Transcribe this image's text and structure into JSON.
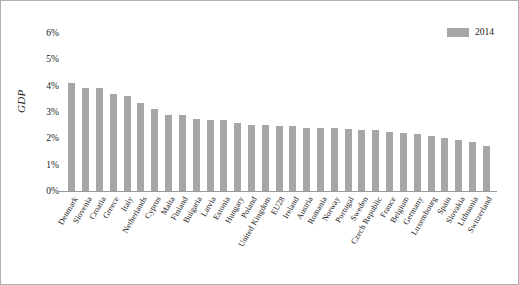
{
  "chart_data": {
    "type": "bar",
    "title": "",
    "xlabel": "",
    "ylabel": "GDP",
    "ylim": [
      0,
      6
    ],
    "ytick_labels": [
      "6%",
      "5%",
      "4%",
      "3%",
      "2%",
      "1%",
      "0%"
    ],
    "ytick_values": [
      6,
      5,
      4,
      3,
      2,
      1,
      0
    ],
    "grid": false,
    "legend_position": "top-right",
    "legend": [
      "2014"
    ],
    "series_name": "2014",
    "bar_color": "#a6a6a6",
    "categories": [
      "Denmark",
      "Slovenia",
      "Croatia",
      "Greece",
      "Italy",
      "Netherlands",
      "Cyprus",
      "Malta",
      "Finland",
      "Bulgaria",
      "Latvia",
      "Estonia",
      "Hungary",
      "Poland",
      "United Kingdom",
      "EU28",
      "Ireland",
      "Austria",
      "Romania",
      "Norway",
      "Portugal",
      "Sweden",
      "Czech Republic",
      "France",
      "Belgium",
      "Germany",
      "Luxembourg",
      "Spain",
      "Slovakia",
      "Lithuania",
      "Switzerland"
    ],
    "values": [
      4.1,
      3.9,
      3.9,
      3.7,
      3.6,
      3.35,
      3.1,
      2.9,
      2.9,
      2.75,
      2.7,
      2.7,
      2.6,
      2.5,
      2.5,
      2.45,
      2.45,
      2.4,
      2.4,
      2.4,
      2.35,
      2.3,
      2.3,
      2.25,
      2.2,
      2.15,
      2.1,
      2.0,
      1.95,
      1.85,
      1.7
    ]
  },
  "legend": {
    "label": "2014"
  },
  "axis": {
    "y_title": "GDP"
  }
}
